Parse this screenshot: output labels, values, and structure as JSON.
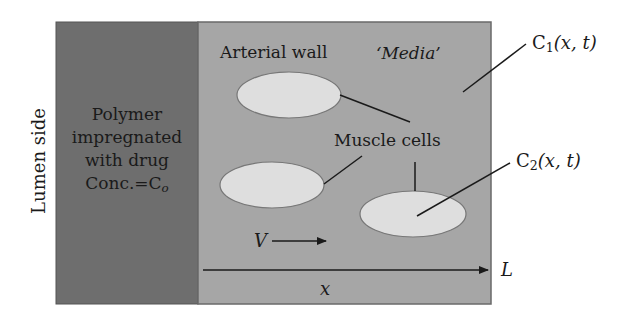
{
  "diagram": {
    "type": "drug-diffusion-schematic",
    "colors": {
      "polymer_region": "#6e6e6e",
      "media_region": "#a6a6a6",
      "muscle_cell_fill": "#dedede",
      "line": "#1a1a1a",
      "background": "#ffffff"
    },
    "labels": {
      "lumen_side": "Lumen side",
      "polymer": {
        "line1": "Polymer",
        "line2": "impregnated",
        "line3": "with drug",
        "line4_prefix": "Conc.=C",
        "line4_sub": "o"
      },
      "arterial_wall": "Arterial wall",
      "media": "‘Media’",
      "muscle_cells": "Muscle cells",
      "c1": {
        "symbol": "C",
        "sub": "1",
        "args": "(x, t)"
      },
      "c2": {
        "symbol": "C",
        "sub": "2",
        "args": "(x, t)"
      },
      "velocity": "V",
      "axis_end": "L",
      "axis_var": "x"
    },
    "regions": [
      {
        "name": "polymer-layer",
        "x": 56,
        "y": 22,
        "width": 142,
        "height": 282
      },
      {
        "name": "media-layer",
        "x": 198,
        "y": 22,
        "width": 293,
        "height": 282
      }
    ],
    "muscle_cells": [
      {
        "cx": 289,
        "cy": 95,
        "rx": 52,
        "ry": 23
      },
      {
        "cx": 272,
        "cy": 185,
        "rx": 52,
        "ry": 23
      },
      {
        "cx": 413,
        "cy": 214,
        "rx": 53,
        "ry": 23
      }
    ]
  }
}
